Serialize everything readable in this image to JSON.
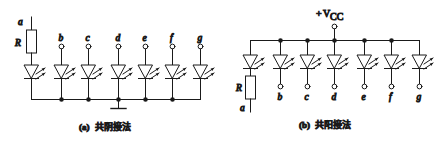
{
  "figure": {
    "stroke_color": "#1a1a1a",
    "background": "#ffffff"
  },
  "panel_a": {
    "caption_index": "(a)",
    "caption_text": "共阴接法",
    "resistor_label": "R",
    "terminal_a": "a",
    "segment_labels": [
      "b",
      "c",
      "d",
      "e",
      "f",
      "g"
    ],
    "ground_label": "",
    "branch_count": 7,
    "led_name": "light-emitting-diode"
  },
  "panel_b": {
    "caption_index": "(b)",
    "caption_text": "共阳接法",
    "supply_sign": "+",
    "supply_symbol": "V",
    "supply_subscript": "CC",
    "resistor_label": "R",
    "terminal_a": "a",
    "segment_labels": [
      "b",
      "c",
      "d",
      "e",
      "f",
      "g"
    ],
    "branch_count": 7,
    "led_name": "light-emitting-diode"
  }
}
